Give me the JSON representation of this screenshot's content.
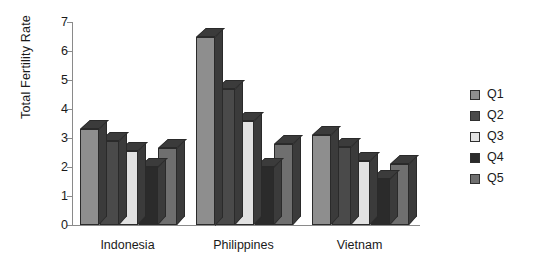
{
  "chart_data": {
    "type": "bar",
    "title": "",
    "xlabel": "",
    "ylabel": "Total Fertility Rate",
    "ylim": [
      0,
      7
    ],
    "ytick_labels": [
      "0",
      "1",
      "2",
      "3",
      "4",
      "5",
      "6",
      "7"
    ],
    "grid": false,
    "legend_position": "right",
    "style": "3d-grouped-bar",
    "categories": [
      "Indonesia",
      "Philippines",
      "Vietnam"
    ],
    "series": [
      {
        "name": "Q1",
        "color": "#8e8e8e",
        "values": [
          3.3,
          6.5,
          3.1
        ]
      },
      {
        "name": "Q2",
        "color": "#4a4a4a",
        "values": [
          2.9,
          4.7,
          2.7
        ]
      },
      {
        "name": "Q3",
        "color": "#e2e2e2",
        "values": [
          2.55,
          3.6,
          2.2
        ]
      },
      {
        "name": "Q4",
        "color": "#2b2b2b",
        "values": [
          2.0,
          2.0,
          1.6
        ]
      },
      {
        "name": "Q5",
        "color": "#6f6f6f",
        "values": [
          2.65,
          2.8,
          2.1
        ]
      }
    ]
  },
  "axis": {
    "y_title": "Total Fertility Rate"
  },
  "colors": {
    "axis": "#8a8a8a",
    "text": "#1a1a1a",
    "background": "#ffffff",
    "bar_outline": "#2a2a2a",
    "side_face": "#3b3b3b"
  }
}
